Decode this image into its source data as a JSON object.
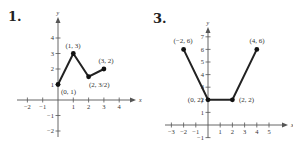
{
  "problems": [
    {
      "number": "1."
    },
    {
      "number": "3."
    }
  ],
  "chart_data": [
    {
      "type": "line",
      "title": "1.",
      "xlabel": "x",
      "ylabel": "y",
      "xlim": [
        -2,
        4
      ],
      "ylim": [
        -2,
        4
      ],
      "x_ticks": [
        -2,
        -1,
        1,
        2,
        3,
        4
      ],
      "y_ticks": [
        -2,
        -1,
        1,
        2,
        3,
        4
      ],
      "grid": false,
      "series": [
        {
          "name": "piecewise",
          "x": [
            0,
            1,
            2,
            3
          ],
          "y": [
            1,
            3,
            1.5,
            2
          ]
        }
      ],
      "annotations": [
        "(0, 1)",
        "(1, 3)",
        "(2, 3/2)",
        "(3, 2)"
      ]
    },
    {
      "type": "line",
      "title": "3.",
      "xlabel": "x",
      "ylabel": "y",
      "xlim": [
        -3,
        5
      ],
      "ylim": [
        -1,
        7
      ],
      "x_ticks": [
        -3,
        -2,
        -1,
        1,
        2,
        3,
        4,
        5
      ],
      "y_ticks": [
        -1,
        1,
        2,
        3,
        4,
        5,
        6,
        7
      ],
      "grid": false,
      "series": [
        {
          "name": "piecewise",
          "x": [
            -2,
            0,
            2,
            4
          ],
          "y": [
            6,
            2,
            2,
            6
          ]
        }
      ],
      "annotations": [
        "(-2, 6)",
        "(0, 2)",
        "(2, 2)",
        "(4, 6)"
      ]
    }
  ]
}
